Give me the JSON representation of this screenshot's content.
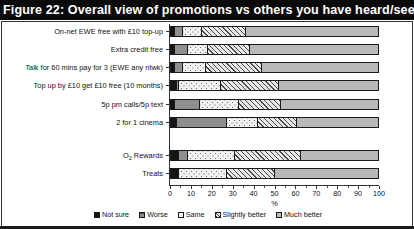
{
  "figure": {
    "title": "Figure 22: Overall view of promotions vs others you have heard/seen"
  },
  "chart_data": {
    "type": "bar",
    "orientation": "horizontal",
    "stacked": true,
    "normalized": true,
    "title": "Figure 22: Overall view of promotions vs others you have heard/seen",
    "xlabel": "%",
    "ylabel": "",
    "xlim": [
      0,
      100
    ],
    "xticks": [
      0,
      10,
      20,
      30,
      40,
      50,
      60,
      70,
      80,
      90,
      100
    ],
    "xtick_labels": [
      "0",
      "10",
      "20",
      "30",
      "40",
      "50",
      "60",
      "70",
      "80",
      "90",
      "100"
    ],
    "grid": false,
    "legend_position": "bottom",
    "legend": [
      "Not sure",
      "Worse",
      "Same",
      "Slightly better",
      "Much better"
    ],
    "categories": [
      "On-net EWE free with £10 top-up",
      "Extra credit free",
      "Talk for 60 mins pay for 3 (EWE any ntwk)",
      "Top up by £10 get £10 free (10 months)",
      "5p pm calls/5p text",
      "2 for 1 cinema",
      "O2 Rewards",
      "Treats"
    ],
    "series": [
      {
        "name": "Not sure",
        "values": [
          2,
          2,
          2,
          3,
          2,
          3,
          4,
          4
        ]
      },
      {
        "name": "Worse",
        "values": [
          4,
          6,
          4,
          1,
          12,
          24,
          4,
          0
        ]
      },
      {
        "name": "Same",
        "values": [
          9,
          10,
          11,
          20,
          19,
          15,
          23,
          23
        ]
      },
      {
        "name": "Slightly better",
        "values": [
          21,
          20,
          27,
          28,
          20,
          19,
          32,
          23
        ]
      },
      {
        "name": "Much better",
        "values": [
          64,
          62,
          56,
          48,
          47,
          39,
          37,
          50
        ]
      }
    ]
  },
  "axis": {
    "x_title": "%",
    "tick_labels": [
      "0",
      "10",
      "20",
      "30",
      "40",
      "50",
      "60",
      "70",
      "80",
      "90",
      "100"
    ]
  },
  "y_labels": [
    {
      "text": "On-net EWE free with £10 top-up",
      "sub": null
    },
    {
      "text": "Extra credit free",
      "sub": null
    },
    {
      "text": "Talk for 60 mins pay for 3 (EWE any ntwk)",
      "sub": null
    },
    {
      "text": "Top up by £10 get £10 free (10 months)",
      "sub": null
    },
    {
      "text": "5p pm calls/5p text",
      "sub": null
    },
    {
      "text": "2 for 1 cinema",
      "sub": null
    },
    {
      "text": "O",
      "sub": "2",
      "tail": " Rewards"
    },
    {
      "text": "Treats",
      "sub": null
    }
  ],
  "legend": {
    "items": [
      {
        "label": "Not sure",
        "key": "notsure",
        "color": "#141414"
      },
      {
        "label": "Worse",
        "key": "worse",
        "color": "#8f8f8f"
      },
      {
        "label": "Same",
        "key": "same",
        "color": "#f4f4f4"
      },
      {
        "label": "Slightly better",
        "key": "slight",
        "color": "#eaeaea"
      },
      {
        "label": "Much better",
        "key": "much",
        "color": "#bcbcbc"
      }
    ]
  },
  "colors": {
    "title_bar_bg": "#0a0a0a",
    "title_text": "#ffffff",
    "frame": "#333333",
    "plot_bg": "#ffffff"
  }
}
